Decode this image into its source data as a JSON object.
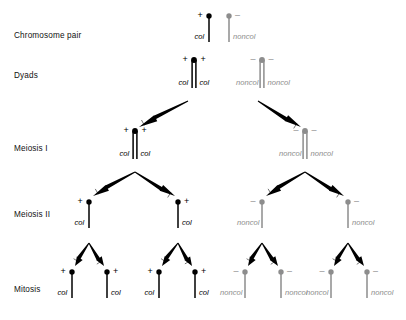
{
  "diagram": {
    "title_present": false,
    "colors": {
      "collected_dark": "#000000",
      "noncollected_gray": "#8d8d8d",
      "arrow": "#000000",
      "text": "#111111",
      "background": "#ffffff"
    },
    "row_labels": [
      {
        "id": "chromosome-pair",
        "label": "Chromosome pair",
        "x": 14,
        "y": 31
      },
      {
        "id": "dyads",
        "label": "Dyads",
        "x": 14,
        "y": 71
      },
      {
        "id": "meiosis-1",
        "label": "Meiosis I",
        "x": 14,
        "y": 144
      },
      {
        "id": "meiosis-2",
        "label": "Meiosis II",
        "x": 14,
        "y": 210
      },
      {
        "id": "mitosis",
        "label": "Mitosis",
        "x": 14,
        "y": 285
      }
    ],
    "allele_symbols": {
      "collected": "+",
      "noncollected": "–"
    },
    "gene_labels": {
      "collected": "col",
      "noncollected": "noncol"
    },
    "chromosomes": [
      {
        "id": "cp-col",
        "stage": "chromosome-pair",
        "type": "single",
        "allele": "+",
        "gene": "col",
        "color": "dark",
        "cx": 209,
        "cy": 16,
        "len": 26,
        "allele_side": "left",
        "gene_side": "left"
      },
      {
        "id": "cp-noncol",
        "stage": "chromosome-pair",
        "type": "single",
        "allele": "–",
        "gene": "noncol",
        "color": "gray",
        "cx": 229,
        "cy": 16,
        "len": 26,
        "allele_side": "right",
        "gene_side": "right"
      },
      {
        "id": "dy-col",
        "stage": "dyads",
        "type": "dyad",
        "allele": "+",
        "gene": "col",
        "color": "dark",
        "cx": 194,
        "cy": 60,
        "len": 28,
        "allele_side": "both",
        "gene_side": "both"
      },
      {
        "id": "dy-noncol",
        "stage": "dyads",
        "type": "dyad",
        "allele": "–",
        "gene": "noncol",
        "color": "gray",
        "cx": 262,
        "cy": 60,
        "len": 28,
        "allele_side": "both",
        "gene_side": "both"
      },
      {
        "id": "m1-col",
        "stage": "meiosis-1",
        "type": "dyad",
        "allele": "+",
        "gene": "col",
        "color": "dark",
        "cx": 135,
        "cy": 131,
        "len": 28,
        "allele_side": "both",
        "gene_side": "both"
      },
      {
        "id": "m1-noncol",
        "stage": "meiosis-1",
        "type": "dyad",
        "allele": "–",
        "gene": "noncol",
        "color": "gray",
        "cx": 305,
        "cy": 131,
        "len": 28,
        "allele_side": "both",
        "gene_side": "both"
      },
      {
        "id": "m2-col-a",
        "stage": "meiosis-2",
        "type": "single",
        "allele": "+",
        "gene": "col",
        "color": "dark",
        "cx": 89,
        "cy": 202,
        "len": 26,
        "allele_side": "left",
        "gene_side": "left"
      },
      {
        "id": "m2-col-b",
        "stage": "meiosis-2",
        "type": "single",
        "allele": "+",
        "gene": "col",
        "color": "dark",
        "cx": 178,
        "cy": 202,
        "len": 26,
        "allele_side": "right",
        "gene_side": "right"
      },
      {
        "id": "m2-noncol-a",
        "stage": "meiosis-2",
        "type": "single",
        "allele": "–",
        "gene": "noncol",
        "color": "gray",
        "cx": 262,
        "cy": 202,
        "len": 26,
        "allele_side": "left",
        "gene_side": "left"
      },
      {
        "id": "m2-noncol-b",
        "stage": "meiosis-2",
        "type": "single",
        "allele": "–",
        "gene": "noncol",
        "color": "gray",
        "cx": 348,
        "cy": 202,
        "len": 26,
        "allele_side": "right",
        "gene_side": "right"
      },
      {
        "id": "mi-col-1",
        "stage": "mitosis",
        "type": "single",
        "allele": "+",
        "gene": "col",
        "color": "dark",
        "cx": 72,
        "cy": 272,
        "len": 26,
        "allele_side": "left",
        "gene_side": "left"
      },
      {
        "id": "mi-col-2",
        "stage": "mitosis",
        "type": "single",
        "allele": "+",
        "gene": "col",
        "color": "dark",
        "cx": 107,
        "cy": 272,
        "len": 26,
        "allele_side": "right",
        "gene_side": "right"
      },
      {
        "id": "mi-col-3",
        "stage": "mitosis",
        "type": "single",
        "allele": "+",
        "gene": "col",
        "color": "dark",
        "cx": 159,
        "cy": 272,
        "len": 26,
        "allele_side": "left",
        "gene_side": "left"
      },
      {
        "id": "mi-col-4",
        "stage": "mitosis",
        "type": "single",
        "allele": "+",
        "gene": "col",
        "color": "dark",
        "cx": 195,
        "cy": 272,
        "len": 26,
        "allele_side": "right",
        "gene_side": "right"
      },
      {
        "id": "mi-noncol-1",
        "stage": "mitosis",
        "type": "single",
        "allele": "–",
        "gene": "noncol",
        "color": "gray",
        "cx": 245,
        "cy": 272,
        "len": 26,
        "allele_side": "left",
        "gene_side": "left"
      },
      {
        "id": "mi-noncol-2",
        "stage": "mitosis",
        "type": "single",
        "allele": "–",
        "gene": "noncol",
        "color": "gray",
        "cx": 281,
        "cy": 272,
        "len": 26,
        "allele_side": "right",
        "gene_side": "right"
      },
      {
        "id": "mi-noncol-3",
        "stage": "mitosis",
        "type": "single",
        "allele": "–",
        "gene": "noncol",
        "color": "gray",
        "cx": 331,
        "cy": 272,
        "len": 26,
        "allele_side": "left",
        "gene_side": "left"
      },
      {
        "id": "mi-noncol-4",
        "stage": "mitosis",
        "type": "single",
        "allele": "–",
        "gene": "noncol",
        "color": "gray",
        "cx": 367,
        "cy": 272,
        "len": 26,
        "allele_side": "right",
        "gene_side": "right"
      }
    ],
    "arrows": [
      {
        "id": "arrow-dyad-col-to-m1",
        "from": [
          188,
          101
        ],
        "to": [
          139,
          127
        ]
      },
      {
        "id": "arrow-dyad-noncol-to-m1",
        "from": [
          258,
          101
        ],
        "to": [
          301,
          127
        ]
      },
      {
        "id": "arrow-m1-col-to-m2-a",
        "from": [
          135,
          172
        ],
        "to": [
          93,
          196
        ]
      },
      {
        "id": "arrow-m1-col-to-m2-b",
        "from": [
          135,
          172
        ],
        "to": [
          175,
          196
        ]
      },
      {
        "id": "arrow-m1-noncol-to-m2-a",
        "from": [
          305,
          172
        ],
        "to": [
          266,
          196
        ]
      },
      {
        "id": "arrow-m1-noncol-to-m2-b",
        "from": [
          305,
          172
        ],
        "to": [
          344,
          196
        ]
      },
      {
        "id": "arrow-m2-col-a-to-mi-1",
        "from": [
          89,
          243
        ],
        "to": [
          75,
          266
        ]
      },
      {
        "id": "arrow-m2-col-a-to-mi-2",
        "from": [
          89,
          243
        ],
        "to": [
          104,
          266
        ]
      },
      {
        "id": "arrow-m2-col-b-to-mi-3",
        "from": [
          178,
          243
        ],
        "to": [
          162,
          266
        ]
      },
      {
        "id": "arrow-m2-col-b-to-mi-4",
        "from": [
          178,
          243
        ],
        "to": [
          192,
          266
        ]
      },
      {
        "id": "arrow-m2-noncol-a-to-mi-1",
        "from": [
          262,
          243
        ],
        "to": [
          248,
          266
        ]
      },
      {
        "id": "arrow-m2-noncol-a-to-mi-2",
        "from": [
          262,
          243
        ],
        "to": [
          278,
          266
        ]
      },
      {
        "id": "arrow-m2-noncol-b-to-mi-3",
        "from": [
          348,
          243
        ],
        "to": [
          334,
          266
        ]
      },
      {
        "id": "arrow-m2-noncol-b-to-mi-4",
        "from": [
          348,
          243
        ],
        "to": [
          364,
          266
        ]
      }
    ]
  }
}
